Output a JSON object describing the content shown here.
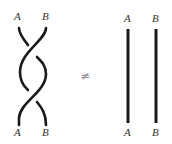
{
  "diagram": {
    "left": {
      "top_labels": [
        "A",
        "B"
      ],
      "bottom_labels": [
        "A",
        "B"
      ],
      "description": "Two strands twisted twice (braid)"
    },
    "relation_symbol": "≠",
    "right": {
      "top_labels": [
        "A",
        "B"
      ],
      "bottom_labels": [
        "A",
        "B"
      ],
      "description": "Two parallel straight strands"
    },
    "stroke_color": "#1a1a1a"
  }
}
